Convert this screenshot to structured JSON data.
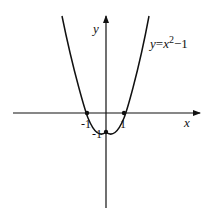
{
  "diagram": {
    "type": "function-graph",
    "function_label": {
      "y": "y",
      "eq": "=",
      "x": "x",
      "exp": "2",
      "rest": "−1"
    },
    "axes": {
      "x_label": "x",
      "y_label": "y"
    },
    "points": [
      {
        "label": "-1",
        "x": -1,
        "y": 0
      },
      {
        "label": "1",
        "x": 1,
        "y": 0
      },
      {
        "label": "-1",
        "x": 0,
        "y": -1
      }
    ],
    "colors": {
      "stroke": "#111111",
      "background": "#ffffff"
    }
  }
}
